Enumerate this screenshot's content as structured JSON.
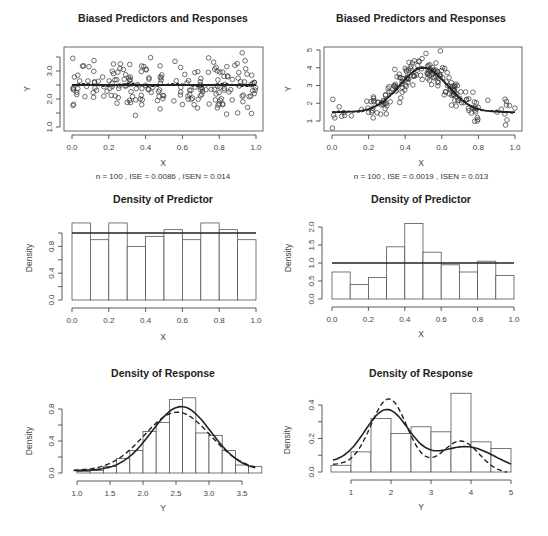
{
  "figure": {
    "layout": "3 rows x 2 columns of R base-graphics plots"
  },
  "chart_data": [
    {
      "id": "p1",
      "type": "scatter",
      "title": "Biased Predictors and Responses",
      "xlabel": "X",
      "ylabel": "Y",
      "subtitle": "n =  100 ,  ISE =  0.0086 ,  ISEN =  0.014",
      "xlim": [
        0.0,
        1.0
      ],
      "ylim": [
        1.0,
        3.7
      ],
      "xticks": [
        "0.0",
        "0.2",
        "0.4",
        "0.6",
        "0.8",
        "1.0"
      ],
      "yticks": [
        "1.0",
        "2.0",
        "3.0"
      ],
      "ytick_values": [
        1.0,
        1.5,
        2.0,
        2.5,
        3.0,
        3.5
      ],
      "ytick_labels_at": [
        1.0,
        2.0,
        3.0
      ],
      "true_curve": "constant ~2.5 (solid)",
      "estimate_curve": "~2.5 with slight variation (dashed)",
      "n_points": 200
    },
    {
      "id": "p2",
      "type": "scatter",
      "title": "Biased Predictors and Responses",
      "xlabel": "X",
      "ylabel": "Y",
      "subtitle": "n =  100 ,  ISE =  0.0019 ,  ISEN =  0.013",
      "xlim": [
        0.0,
        1.0
      ],
      "ylim": [
        0.6,
        5.0
      ],
      "xticks": [
        "0.0",
        "0.2",
        "0.4",
        "0.6",
        "0.8",
        "1.0"
      ],
      "yticks": [
        "1",
        "2",
        "3",
        "4",
        "5"
      ],
      "true_curve": "bell: 1.5 + 2.5*exp(-((x-0.5)^2)/(2*0.13^2))",
      "n_points": 200
    },
    {
      "id": "p3",
      "type": "bar",
      "title": "Density of Predictor",
      "xlabel": "X",
      "ylabel": "Density",
      "xlim": [
        0.0,
        1.0
      ],
      "ylim": [
        0.0,
        1.15
      ],
      "xticks": [
        "0.0",
        "0.2",
        "0.4",
        "0.6",
        "0.8",
        "1.0"
      ],
      "yticks": [
        "0.0",
        "0.4",
        "0.8"
      ],
      "bin_edges": [
        0.0,
        0.1,
        0.2,
        0.3,
        0.4,
        0.5,
        0.6,
        0.7,
        0.8,
        0.9,
        1.0
      ],
      "values": [
        1.15,
        0.9,
        1.15,
        0.8,
        0.95,
        1.05,
        0.9,
        1.15,
        1.05,
        0.9
      ],
      "reference_line": 1.0
    },
    {
      "id": "p4",
      "type": "bar",
      "title": "Density of Predictor",
      "xlabel": "X",
      "ylabel": "Density",
      "xlim": [
        0.0,
        1.0
      ],
      "ylim": [
        0.0,
        2.1
      ],
      "xticks": [
        "0.0",
        "0.2",
        "0.4",
        "0.6",
        "0.8",
        "1.0"
      ],
      "yticks": [
        "0.0",
        "0.5",
        "1.0",
        "1.5",
        "2.0"
      ],
      "bin_edges": [
        0.0,
        0.1,
        0.2,
        0.3,
        0.4,
        0.5,
        0.6,
        0.7,
        0.8,
        0.9,
        1.0
      ],
      "values": [
        0.75,
        0.4,
        0.6,
        1.45,
        2.1,
        1.3,
        0.95,
        0.75,
        1.05,
        0.65
      ],
      "reference_line": 1.0
    },
    {
      "id": "p5",
      "type": "bar",
      "title": "Density of Response",
      "xlabel": "Y",
      "ylabel": "Density",
      "xlim": [
        1.0,
        3.8
      ],
      "ylim": [
        0.0,
        0.95
      ],
      "xticks": [
        "1.0",
        "1.5",
        "2.0",
        "2.5",
        "3.0",
        "3.5"
      ],
      "yticks": [
        "0.0",
        "0.4",
        "0.8"
      ],
      "bin_edges": [
        1.0,
        1.2,
        1.4,
        1.6,
        1.8,
        2.0,
        2.2,
        2.4,
        2.6,
        2.8,
        3.0,
        3.2,
        3.4,
        3.6,
        3.8
      ],
      "values": [
        0.02,
        0.03,
        0.08,
        0.18,
        0.28,
        0.52,
        0.63,
        0.92,
        0.94,
        0.5,
        0.47,
        0.28,
        0.1,
        0.08
      ],
      "series": [
        {
          "name": "true density (solid)",
          "style": "solid",
          "peak_x": 2.58,
          "peak_y": 0.83
        },
        {
          "name": "estimated density (dashed)",
          "style": "dashed",
          "peak_x": 2.55,
          "peak_y": 0.76
        }
      ]
    },
    {
      "id": "p6",
      "type": "bar",
      "title": "Density of Response",
      "xlabel": "Y",
      "ylabel": "Density",
      "xlim": [
        0.5,
        5.0
      ],
      "ylim": [
        0.0,
        0.47
      ],
      "xticks": [
        "1",
        "2",
        "3",
        "4",
        "5"
      ],
      "yticks": [
        "0.0",
        "0.2",
        "0.4"
      ],
      "bin_edges": [
        0.5,
        1.0,
        1.5,
        2.0,
        2.5,
        3.0,
        3.5,
        4.0,
        4.5,
        5.0
      ],
      "values": [
        0.04,
        0.12,
        0.32,
        0.23,
        0.27,
        0.24,
        0.47,
        0.18,
        0.14
      ],
      "series": [
        {
          "name": "true density (solid)",
          "style": "solid",
          "peak_x": 1.9,
          "peak_y": 0.4
        },
        {
          "name": "estimated density (dashed)",
          "style": "dashed",
          "peak_x": 1.95,
          "peak_y": 0.46
        }
      ]
    }
  ]
}
